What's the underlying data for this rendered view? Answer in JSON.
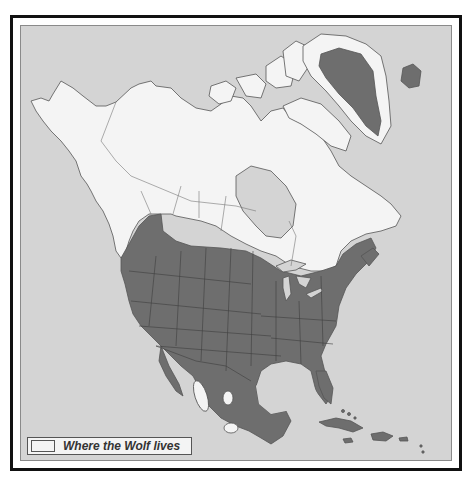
{
  "map": {
    "title": "Wolf range map of North America",
    "colors": {
      "sea": "#d4d4d4",
      "wolf_range": "#f4f4f4",
      "no_wolves": "#6e6e6e",
      "borders": "#444444",
      "frame": "#111111"
    },
    "regions": {
      "wolf_range": [
        "Alaska",
        "Canada",
        "Greenland coast",
        "Mexican highland patches"
      ],
      "no_wolves": [
        "Contiguous United States",
        "Mexico",
        "Central America",
        "Caribbean",
        "Greenland interior",
        "Iceland"
      ]
    }
  },
  "legend": {
    "swatch_color": "#f4f4f4",
    "label": "Where the Wolf lives"
  }
}
